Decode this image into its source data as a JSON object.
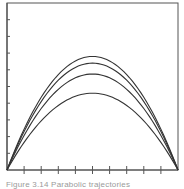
{
  "chart_data": {
    "type": "line",
    "title": "",
    "xlabel": "",
    "ylabel": "",
    "xlim": [
      0,
      10
    ],
    "ylim": [
      0,
      10
    ],
    "x_ticks": [
      1,
      2,
      3,
      4,
      5,
      6,
      7,
      8,
      9
    ],
    "y_ticks": [
      1,
      2,
      3,
      4,
      5,
      6,
      7,
      8,
      9
    ],
    "grid": false,
    "legend": null,
    "series": [
      {
        "name": "curve-1",
        "shape": "parabola",
        "x_start": 0,
        "x_end": 10,
        "peak_x": 5,
        "peak_y": 6.8
      },
      {
        "name": "curve-2",
        "shape": "parabola",
        "x_start": 0,
        "x_end": 10,
        "peak_x": 5,
        "peak_y": 6.4
      },
      {
        "name": "curve-3",
        "shape": "parabola",
        "x_start": 0,
        "x_end": 10,
        "peak_x": 5,
        "peak_y": 5.75
      },
      {
        "name": "curve-4",
        "shape": "parabola",
        "x_start": 0,
        "x_end": 10,
        "peak_x": 5,
        "peak_y": 4.6
      }
    ],
    "colors": {
      "line": "#333333",
      "frame": "#555555",
      "background": "#ffffff"
    }
  },
  "caption": "Figure 3.14  Parabolic trajectories"
}
